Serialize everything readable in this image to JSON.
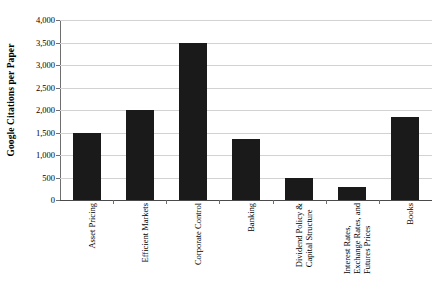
{
  "chart_data": {
    "type": "bar",
    "title": "",
    "subtitle": "",
    "xlabel": "",
    "ylabel": "Google Citations per Paper",
    "ylim": [
      0,
      4000
    ],
    "ytick_step": 500,
    "grid": true,
    "legend": false,
    "orientation": "vertical",
    "bar_color": "#1a1a1a",
    "categories": [
      "Asset Pricing",
      "Efficient Markets",
      "Corporate Control",
      "Banking",
      "Dividend Policy & Capital Structure",
      "Interest Rates, Exchange Rates, and Futures Prices",
      "Books"
    ],
    "category_lines": [
      [
        "Asset Pricing"
      ],
      [
        "Efficient Markets"
      ],
      [
        "Corporate Control"
      ],
      [
        "Banking"
      ],
      [
        "Dividend Policy &",
        "Capital Structure"
      ],
      [
        "Interest Rates,",
        "Exchange Rates, and",
        "Futures Prices"
      ],
      [
        "Books"
      ]
    ],
    "values": [
      1500,
      2000,
      3500,
      1350,
      480,
      300,
      1850
    ],
    "ytick_labels": [
      "0",
      "500",
      "1,000",
      "1,500",
      "2,000",
      "2,500",
      "3,000",
      "3,500",
      "4,000"
    ],
    "ytick_values": [
      0,
      500,
      1000,
      1500,
      2000,
      2500,
      3000,
      3500,
      4000
    ]
  }
}
